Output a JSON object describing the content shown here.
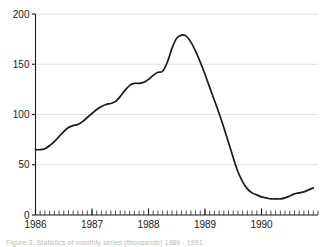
{
  "figure": {
    "caption": "Figure 3. Statistics of monthly series (thousands) 1986 - 1991."
  },
  "chart_data": {
    "type": "line",
    "title": "",
    "subtitle": "",
    "xlabel": "",
    "ylabel": "",
    "xlim": [
      1986.0,
      1991.0
    ],
    "ylim": [
      0,
      200
    ],
    "grid": true,
    "grid_axis": "y",
    "legend": false,
    "legend_position": "none",
    "line_color": "#1a1a1a",
    "grid_color": "#d8d8d8",
    "axis_color": "#1a1a1a",
    "background": "#ffffff",
    "ytick_values": [
      0,
      50,
      100,
      150,
      200
    ],
    "ytick_labels": [
      "0",
      "50",
      "100",
      "150",
      "200"
    ],
    "xtick_values": [
      1986,
      1987,
      1988,
      1989,
      1990
    ],
    "xtick_labels": [
      "1986",
      "1987",
      "1988",
      "1989",
      "1990"
    ],
    "minor_xticks": "monthly",
    "x": [
      1986.0,
      1986.083,
      1986.167,
      1986.25,
      1986.333,
      1986.417,
      1986.5,
      1986.583,
      1986.667,
      1986.75,
      1986.833,
      1986.917,
      1987.0,
      1987.083,
      1987.167,
      1987.25,
      1987.333,
      1987.417,
      1987.5,
      1987.583,
      1987.667,
      1987.75,
      1987.833,
      1987.917,
      1988.0,
      1988.083,
      1988.167,
      1988.25,
      1988.333,
      1988.417,
      1988.5,
      1988.583,
      1988.667,
      1988.75,
      1988.833,
      1988.917,
      1989.0,
      1989.083,
      1989.167,
      1989.25,
      1989.333,
      1989.417,
      1989.5,
      1989.583,
      1989.667,
      1989.75,
      1989.833,
      1989.917,
      1990.0,
      1990.083,
      1990.167,
      1990.25,
      1990.333,
      1990.417,
      1990.5,
      1990.583,
      1990.667,
      1990.75,
      1990.833,
      1990.917
    ],
    "values": [
      65,
      65,
      66,
      69,
      73,
      78,
      83,
      87,
      89,
      90,
      93,
      97,
      101,
      105,
      108,
      110,
      111,
      113,
      118,
      124,
      129,
      131,
      131,
      132,
      135,
      139,
      142,
      143,
      152,
      166,
      176,
      179,
      178,
      172,
      163,
      152,
      140,
      127,
      114,
      101,
      87,
      72,
      57,
      43,
      33,
      26,
      22,
      20,
      18,
      17,
      16,
      16,
      16,
      17,
      19,
      21,
      22,
      23,
      25,
      27
    ],
    "annotations": [
      {
        "label": "peak",
        "x": 1988.583,
        "y": 179
      },
      {
        "label": "trough",
        "x": 1990.167,
        "y": 16
      },
      {
        "label": "start",
        "x": 1986.0,
        "y": 65
      },
      {
        "label": "end",
        "x": 1990.917,
        "y": 27
      }
    ]
  }
}
